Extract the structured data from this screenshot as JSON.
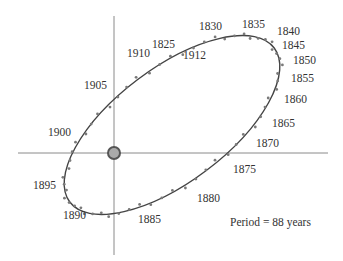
{
  "diagram": {
    "period_label": "Period = 88 years",
    "center_icon": "sun-icon",
    "colors": {
      "orbit": "#444444",
      "points": "#777777",
      "axes": "#888888",
      "sun": "#888888"
    },
    "year_labels": [
      {
        "text": "1830",
        "x": 199,
        "y": 21
      },
      {
        "text": "1835",
        "x": 242,
        "y": 19
      },
      {
        "text": "1840",
        "x": 277,
        "y": 26
      },
      {
        "text": "1845",
        "x": 282,
        "y": 40
      },
      {
        "text": "1850",
        "x": 293,
        "y": 55
      },
      {
        "text": "1855",
        "x": 291,
        "y": 73
      },
      {
        "text": "1860",
        "x": 284,
        "y": 94
      },
      {
        "text": "1865",
        "x": 272,
        "y": 118
      },
      {
        "text": "1870",
        "x": 256,
        "y": 138
      },
      {
        "text": "1875",
        "x": 233,
        "y": 164
      },
      {
        "text": "1880",
        "x": 197,
        "y": 193
      },
      {
        "text": "1885",
        "x": 138,
        "y": 214
      },
      {
        "text": "1890",
        "x": 63,
        "y": 210
      },
      {
        "text": "1895",
        "x": 33,
        "y": 180
      },
      {
        "text": "1900",
        "x": 48,
        "y": 127
      },
      {
        "text": "1905",
        "x": 84,
        "y": 80
      },
      {
        "text": "1910",
        "x": 127,
        "y": 48
      },
      {
        "text": "1912",
        "x": 183,
        "y": 50
      },
      {
        "text": "1825",
        "x": 152,
        "y": 39
      }
    ]
  },
  "chart_data": {
    "type": "scatter",
    "title": "",
    "annotation": "Period = 88 years",
    "labels": [
      "1825",
      "1830",
      "1835",
      "1840",
      "1845",
      "1850",
      "1855",
      "1860",
      "1865",
      "1870",
      "1875",
      "1880",
      "1885",
      "1890",
      "1895",
      "1900",
      "1905",
      "1910",
      "1912"
    ]
  }
}
